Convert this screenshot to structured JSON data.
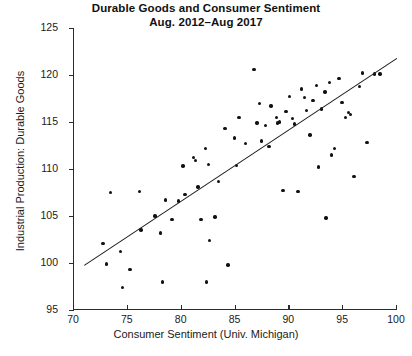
{
  "chart_data": {
    "type": "scatter",
    "title": "Durable Goods and Consumer Sentiment",
    "subtitle": "Aug. 2012–Aug 2017",
    "xlabel": "Consumer Sentiment (Univ. Michigan)",
    "ylabel": "Industrial Production: Durable Goods",
    "xlim": [
      70,
      100
    ],
    "ylim": [
      95,
      125
    ],
    "xticks": [
      70,
      75,
      80,
      85,
      90,
      95,
      100
    ],
    "yticks": [
      95,
      100,
      105,
      110,
      115,
      120,
      125
    ],
    "grid": false,
    "legend": null,
    "marker": "circle",
    "marker_color": "#111111",
    "line_color": "#1a1a1a",
    "trendline": {
      "type": "linear-fit",
      "x_start": 71.0,
      "y_start": 99.8,
      "x_end": 100.0,
      "y_end": 121.8
    },
    "points": [
      {
        "x": 72.8,
        "y": 102.1
      },
      {
        "x": 73.1,
        "y": 99.9
      },
      {
        "x": 73.5,
        "y": 107.5
      },
      {
        "x": 74.4,
        "y": 101.2
      },
      {
        "x": 74.6,
        "y": 97.4
      },
      {
        "x": 75.3,
        "y": 99.3
      },
      {
        "x": 76.2,
        "y": 107.6
      },
      {
        "x": 76.3,
        "y": 103.5
      },
      {
        "x": 77.6,
        "y": 105.0
      },
      {
        "x": 78.1,
        "y": 103.2
      },
      {
        "x": 78.3,
        "y": 98.0
      },
      {
        "x": 78.6,
        "y": 106.7
      },
      {
        "x": 79.2,
        "y": 104.6
      },
      {
        "x": 79.8,
        "y": 106.6
      },
      {
        "x": 80.2,
        "y": 110.3
      },
      {
        "x": 80.4,
        "y": 107.3
      },
      {
        "x": 81.2,
        "y": 111.2
      },
      {
        "x": 81.4,
        "y": 110.9
      },
      {
        "x": 81.6,
        "y": 108.1
      },
      {
        "x": 81.9,
        "y": 104.6
      },
      {
        "x": 82.3,
        "y": 112.2
      },
      {
        "x": 82.4,
        "y": 98.0
      },
      {
        "x": 82.6,
        "y": 110.5
      },
      {
        "x": 82.7,
        "y": 102.4
      },
      {
        "x": 83.2,
        "y": 104.9
      },
      {
        "x": 83.5,
        "y": 108.7
      },
      {
        "x": 84.1,
        "y": 114.3
      },
      {
        "x": 84.4,
        "y": 99.8
      },
      {
        "x": 85.0,
        "y": 113.3
      },
      {
        "x": 85.2,
        "y": 110.4
      },
      {
        "x": 85.4,
        "y": 115.5
      },
      {
        "x": 86.0,
        "y": 112.7
      },
      {
        "x": 86.8,
        "y": 120.6
      },
      {
        "x": 87.1,
        "y": 114.9
      },
      {
        "x": 87.3,
        "y": 117.0
      },
      {
        "x": 87.5,
        "y": 113.0
      },
      {
        "x": 87.9,
        "y": 114.6
      },
      {
        "x": 88.2,
        "y": 112.4
      },
      {
        "x": 88.4,
        "y": 116.7
      },
      {
        "x": 88.9,
        "y": 115.5
      },
      {
        "x": 89.0,
        "y": 114.9
      },
      {
        "x": 89.2,
        "y": 115.0
      },
      {
        "x": 89.5,
        "y": 107.7
      },
      {
        "x": 89.8,
        "y": 116.1
      },
      {
        "x": 90.1,
        "y": 117.7
      },
      {
        "x": 90.4,
        "y": 115.4
      },
      {
        "x": 90.6,
        "y": 114.8
      },
      {
        "x": 90.9,
        "y": 107.6
      },
      {
        "x": 91.2,
        "y": 118.5
      },
      {
        "x": 91.5,
        "y": 117.6
      },
      {
        "x": 91.7,
        "y": 116.2
      },
      {
        "x": 92.0,
        "y": 113.6
      },
      {
        "x": 92.3,
        "y": 117.3
      },
      {
        "x": 92.6,
        "y": 118.9
      },
      {
        "x": 92.8,
        "y": 110.2
      },
      {
        "x": 93.1,
        "y": 116.4
      },
      {
        "x": 93.4,
        "y": 118.2
      },
      {
        "x": 93.5,
        "y": 104.8
      },
      {
        "x": 93.8,
        "y": 119.2
      },
      {
        "x": 94.0,
        "y": 111.5
      },
      {
        "x": 94.3,
        "y": 112.2
      },
      {
        "x": 94.7,
        "y": 119.6
      },
      {
        "x": 95.0,
        "y": 117.1
      },
      {
        "x": 95.3,
        "y": 115.5
      },
      {
        "x": 95.6,
        "y": 116.0
      },
      {
        "x": 95.8,
        "y": 115.8
      },
      {
        "x": 96.1,
        "y": 109.2
      },
      {
        "x": 96.6,
        "y": 118.8
      },
      {
        "x": 96.9,
        "y": 120.2
      },
      {
        "x": 97.3,
        "y": 112.8
      },
      {
        "x": 98.0,
        "y": 120.1
      },
      {
        "x": 98.5,
        "y": 120.1
      }
    ]
  }
}
